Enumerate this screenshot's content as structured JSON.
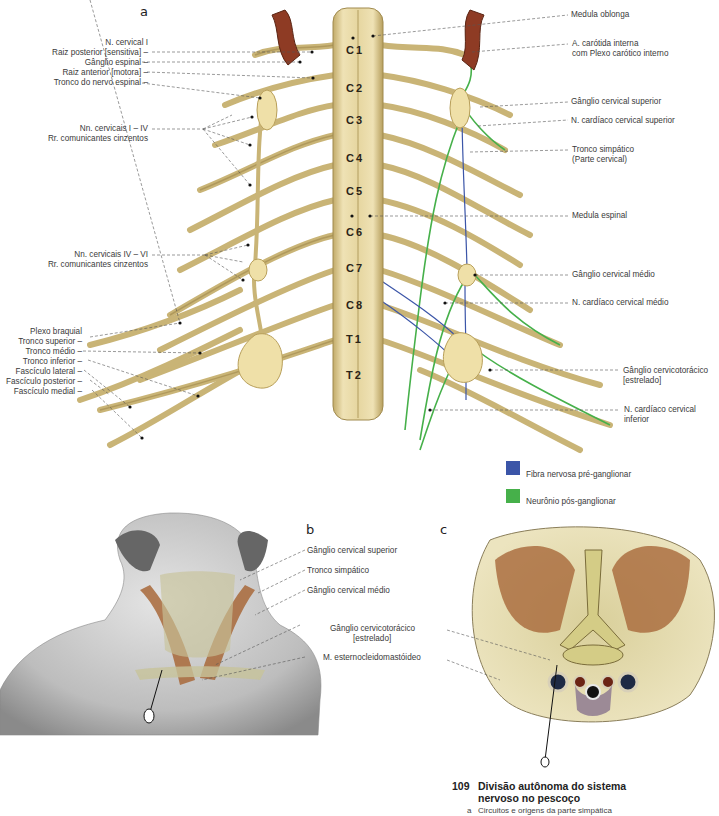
{
  "figure": {
    "number": "109",
    "title_line1": "Divisão autônoma do sistema",
    "title_line2": "nervoso no pescoço",
    "subcaption_letter": "a",
    "subcaption_text": "Circuitos e origens da parte simpática"
  },
  "panel_a": {
    "letter": "a",
    "segments": [
      "C1",
      "C2",
      "C3",
      "C4",
      "C5",
      "C6",
      "C7",
      "C8",
      "T1",
      "T2"
    ],
    "left_labels": [
      "N. cervical I",
      "Raiz posterior [sensitiva] –",
      "Gânglio espinal –",
      "Raiz anterior [motora] –",
      "Tronco do nervo espinal –",
      "Nn. cervicais I – IV",
      "Rr. comunicantes cinzentos",
      "Nn. cervicais IV – VI",
      "Rr. comunicantes cinzentos",
      "Plexo braquial",
      "Tronco superior –",
      "Tronco médio –",
      "Tronco inferior –",
      "Fascículo lateral –",
      "Fascículo posterior –",
      "Fascículo medial –"
    ],
    "right_labels": [
      "Medula oblonga",
      "A. carótida interna",
      "com Plexo carótico interno",
      "Gânglio cervical superior",
      "N. cardíaco cervical superior",
      "Tronco simpático",
      "(Parte cervical)",
      "Medula espinal",
      "Gânglio cervical médio",
      "N. cardíaco cervical médio",
      "Gânglio cervicotorácico",
      "[estrelado]",
      "N. cardíaco cervical",
      "inferior"
    ],
    "legend": [
      {
        "label": "Fibra nervosa pré-ganglionar",
        "color": "#3b55a8"
      },
      {
        "label": "Neurônio pós-ganglionar",
        "color": "#46b04a"
      }
    ]
  },
  "panel_b": {
    "letter": "b",
    "labels": [
      "Gânglio cervical superior",
      "Tronco simpático",
      "Gânglio cervical médio",
      "Gânglio cervicotorácico",
      "[estrelado]",
      "M. esternocleidomastóideo"
    ]
  },
  "panel_c": {
    "letter": "c"
  },
  "colors": {
    "nerve": "#cdb979",
    "nerve_dark": "#9a8447",
    "cord": "#e8d9a6",
    "artery": "#8e3b24",
    "pre": "#3b55a8",
    "post": "#46b04a",
    "muscle": "#a8683a",
    "skin": "#c9c9c9"
  }
}
